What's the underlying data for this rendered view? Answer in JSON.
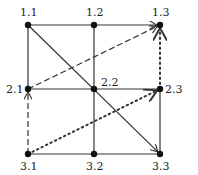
{
  "diagram": {
    "type": "grid-graph",
    "nodes": [
      {
        "id": "1.1",
        "label": "1.1",
        "x": 28,
        "y": 25
      },
      {
        "id": "1.2",
        "label": "1.2",
        "x": 94,
        "y": 25
      },
      {
        "id": "1.3",
        "label": "1.3",
        "x": 160,
        "y": 25
      },
      {
        "id": "2.1",
        "label": "2.1",
        "x": 28,
        "y": 89
      },
      {
        "id": "2.2",
        "label": "2.2",
        "x": 94,
        "y": 89
      },
      {
        "id": "2.3",
        "label": "2.3",
        "x": 160,
        "y": 89
      },
      {
        "id": "3.1",
        "label": "3.1",
        "x": 28,
        "y": 154
      },
      {
        "id": "3.2",
        "label": "3.2",
        "x": 94,
        "y": 154
      },
      {
        "id": "3.3",
        "label": "3.3",
        "x": 160,
        "y": 154
      }
    ],
    "edges": [
      {
        "from": "1.1",
        "to": "1.2",
        "style": "solid",
        "arrow": false
      },
      {
        "from": "1.2",
        "to": "1.3",
        "style": "solid",
        "arrow": true
      },
      {
        "from": "1.1",
        "to": "2.1",
        "style": "solid",
        "arrow": false
      },
      {
        "from": "1.2",
        "to": "2.2",
        "style": "solid",
        "arrow": false
      },
      {
        "from": "2.1",
        "to": "2.2",
        "style": "solid",
        "arrow": false
      },
      {
        "from": "2.2",
        "to": "2.3",
        "style": "solid",
        "arrow": false
      },
      {
        "from": "2.2",
        "to": "3.2",
        "style": "solid",
        "arrow": false
      },
      {
        "from": "2.3",
        "to": "3.3",
        "style": "solid",
        "arrow": false
      },
      {
        "from": "3.1",
        "to": "3.2",
        "style": "solid",
        "arrow": false
      },
      {
        "from": "3.2",
        "to": "3.3",
        "style": "solid",
        "arrow": false
      },
      {
        "from": "1.1",
        "to": "3.3",
        "style": "solid",
        "arrow": true
      },
      {
        "from": "3.1",
        "to": "2.1",
        "style": "dashed",
        "arrow": true
      },
      {
        "from": "2.1",
        "to": "1.3",
        "style": "dashed",
        "arrow": true
      },
      {
        "from": "3.1",
        "to": "2.3",
        "style": "dotted",
        "arrow": true
      },
      {
        "from": "2.3",
        "to": "1.3",
        "style": "dotted",
        "arrow": true
      }
    ],
    "labels": {
      "n11": "1.1",
      "n12": "1.2",
      "n13": "1.3",
      "n21": "2.1",
      "n22": "2.2",
      "n23": "2.3",
      "n31": "3.1",
      "n32": "3.2",
      "n33": "3.3"
    },
    "colors": {
      "line": "#333333",
      "node": "#111111",
      "background": "#ffffff"
    }
  }
}
